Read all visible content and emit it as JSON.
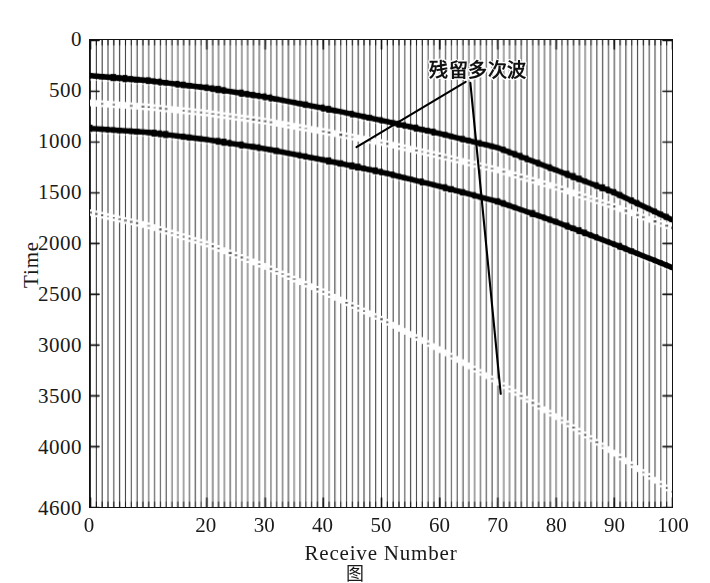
{
  "chart_data": {
    "type": "line",
    "title": "",
    "subtitle": "",
    "xlabel": "Receive Number",
    "ylabel": "Time",
    "xlim": [
      0,
      100
    ],
    "ylim": [
      0,
      4600
    ],
    "y_inverted": true,
    "grid": false,
    "legend_position": "none",
    "plot_style": "seismic-wiggle-trace-gather",
    "n_traces": 100,
    "xticks": [
      0,
      20,
      30,
      40,
      50,
      60,
      70,
      80,
      90,
      100
    ],
    "xtick_labels": [
      "0",
      "20",
      "30",
      "40",
      "50",
      "60",
      "70",
      "80",
      "90",
      "100"
    ],
    "xtick_minor_step": 1,
    "yticks": [
      0,
      500,
      1000,
      1500,
      2000,
      2500,
      3000,
      3500,
      4000,
      4600
    ],
    "ytick_labels": [
      "0",
      "500",
      "1000",
      "1500",
      "2000",
      "2500",
      "3000",
      "3500",
      "4000",
      "4600"
    ],
    "annotations": [
      {
        "text": "残留多次波",
        "meaning": "residual multiples",
        "x": 66,
        "y": 430,
        "leader_lines": [
          {
            "from_x": 64.5,
            "from_y": 420,
            "to_x": 45.8,
            "to_y": 1060
          },
          {
            "from_x": 65.3,
            "from_y": 430,
            "to_x": 70.5,
            "to_y": 3480
          }
        ]
      }
    ],
    "series": [
      {
        "name": "primary-reflection-1",
        "style": "strong-black-event",
        "amplitude": "high",
        "x": [
          0,
          10,
          20,
          30,
          40,
          50,
          60,
          70,
          80,
          90,
          100
        ],
        "values": [
          350,
          400,
          470,
          560,
          670,
          790,
          920,
          1060,
          1280,
          1500,
          1770
        ]
      },
      {
        "name": "primary-reflection-2",
        "style": "strong-black-event",
        "amplitude": "high",
        "x": [
          0,
          10,
          20,
          30,
          40,
          50,
          60,
          70,
          80,
          90,
          100
        ],
        "values": [
          870,
          910,
          980,
          1070,
          1180,
          1300,
          1440,
          1590,
          1790,
          2010,
          2240
        ]
      },
      {
        "name": "residual-multiple-1",
        "style": "faint-dotted-event",
        "amplitude": "low",
        "x": [
          0,
          10,
          20,
          30,
          40,
          50,
          60,
          70,
          80,
          90,
          100
        ],
        "values": [
          620,
          660,
          720,
          800,
          900,
          1010,
          1140,
          1280,
          1450,
          1640,
          1850
        ]
      },
      {
        "name": "residual-multiple-2",
        "style": "faint-dotted-event",
        "amplitude": "low",
        "x": [
          0,
          10,
          20,
          30,
          40,
          50,
          60,
          70,
          80,
          90,
          100
        ],
        "values": [
          1700,
          1830,
          2010,
          2230,
          2480,
          2750,
          3050,
          3370,
          3710,
          4070,
          4450
        ]
      }
    ],
    "colors": {
      "trace": "#222222",
      "event": "#000000",
      "background": "#ffffff",
      "axis": "#111111"
    }
  },
  "axes": {
    "x_title": "Receive Number",
    "y_title": "Time"
  },
  "annotation": {
    "label": "残留多次波"
  },
  "caption": {
    "text": "图"
  }
}
